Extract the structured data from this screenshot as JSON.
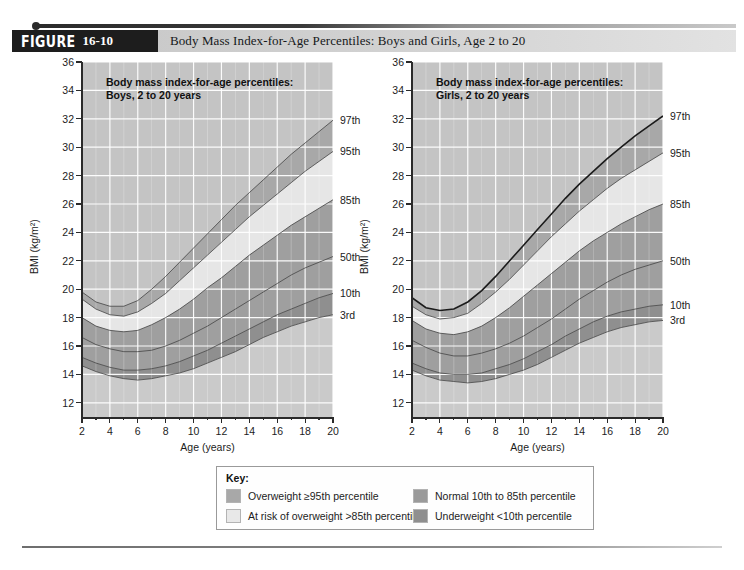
{
  "header": {
    "figure_word": "FIGURE",
    "figure_number": "16-10",
    "title": "Body Mass Index-for-Age Percentiles: Boys and Girls, Age 2 to 20"
  },
  "key": {
    "title": "Key:",
    "items": [
      {
        "label": "Overweight ≥95th percentile",
        "color": "#a8a8a8"
      },
      {
        "label": "At risk of overweight >85th percentile",
        "color": "#e8e8e8"
      },
      {
        "label": "Normal 10th to 85th percentile",
        "color": "#9a9a9a"
      },
      {
        "label": "Underweight <10th percentile",
        "color": "#8f8f8f"
      }
    ]
  },
  "chart_data": [
    {
      "type": "area",
      "id": "boys",
      "title": "Body mass index-for-age percentiles:\nBoys, 2 to 20 years",
      "xlabel": "Age (years)",
      "ylabel": "BMI (kg/m²)",
      "xlim": [
        2,
        20
      ],
      "ylim": [
        11,
        36
      ],
      "grid": true,
      "highlight_series": null,
      "xticks": [
        2,
        4,
        6,
        8,
        10,
        12,
        14,
        16,
        18,
        20
      ],
      "yticks": [
        12,
        14,
        16,
        18,
        20,
        22,
        24,
        26,
        28,
        30,
        32,
        34,
        36
      ],
      "x": [
        2,
        3,
        4,
        5,
        6,
        7,
        8,
        9,
        10,
        11,
        12,
        13,
        14,
        15,
        16,
        17,
        18,
        19,
        20
      ],
      "series": [
        {
          "name": "3rd",
          "label": "3rd",
          "values": [
            14.6,
            14.2,
            13.9,
            13.7,
            13.6,
            13.7,
            13.9,
            14.1,
            14.4,
            14.8,
            15.2,
            15.6,
            16.1,
            16.6,
            17.0,
            17.4,
            17.7,
            18.0,
            18.2
          ]
        },
        {
          "name": "10th",
          "label": "10th",
          "values": [
            15.2,
            14.8,
            14.5,
            14.3,
            14.3,
            14.4,
            14.6,
            14.9,
            15.3,
            15.7,
            16.2,
            16.7,
            17.2,
            17.7,
            18.2,
            18.6,
            19.0,
            19.4,
            19.7
          ]
        },
        {
          "name": "50th",
          "label": "50th",
          "values": [
            16.6,
            16.1,
            15.8,
            15.6,
            15.6,
            15.7,
            16.0,
            16.4,
            16.9,
            17.4,
            18.0,
            18.6,
            19.2,
            19.8,
            20.4,
            21.0,
            21.5,
            21.9,
            22.3
          ]
        },
        {
          "name": "85th",
          "label": "85th",
          "values": [
            18.0,
            17.4,
            17.1,
            17.0,
            17.1,
            17.5,
            18.0,
            18.6,
            19.3,
            20.1,
            20.8,
            21.6,
            22.4,
            23.1,
            23.8,
            24.5,
            25.1,
            25.7,
            26.3
          ]
        },
        {
          "name": "95th",
          "label": "95th",
          "values": [
            19.3,
            18.6,
            18.2,
            18.1,
            18.4,
            19.0,
            19.7,
            20.6,
            21.5,
            22.4,
            23.3,
            24.2,
            25.1,
            25.9,
            26.7,
            27.5,
            28.3,
            29.0,
            29.7
          ]
        },
        {
          "name": "97th",
          "label": "97th",
          "values": [
            19.8,
            19.1,
            18.8,
            18.8,
            19.2,
            20.0,
            20.9,
            21.9,
            22.9,
            23.9,
            24.9,
            25.9,
            26.8,
            27.7,
            28.6,
            29.5,
            30.3,
            31.1,
            31.9
          ]
        }
      ]
    },
    {
      "type": "area",
      "id": "girls",
      "title": "Body mass index-for-age percentiles:\nGirls, 2 to 20 years",
      "xlabel": "Age (years)",
      "ylabel": "BMI (kg/m²)",
      "xlim": [
        2,
        20
      ],
      "ylim": [
        11,
        36
      ],
      "grid": true,
      "highlight_series": "97th",
      "xticks": [
        2,
        4,
        6,
        8,
        10,
        12,
        14,
        16,
        18,
        20
      ],
      "yticks": [
        12,
        14,
        16,
        18,
        20,
        22,
        24,
        26,
        28,
        30,
        32,
        34,
        36
      ],
      "x": [
        2,
        3,
        4,
        5,
        6,
        7,
        8,
        9,
        10,
        11,
        12,
        13,
        14,
        15,
        16,
        17,
        18,
        19,
        20
      ],
      "series": [
        {
          "name": "3rd",
          "label": "3rd",
          "values": [
            14.3,
            13.9,
            13.6,
            13.5,
            13.4,
            13.5,
            13.7,
            14.0,
            14.3,
            14.7,
            15.2,
            15.7,
            16.2,
            16.6,
            17.0,
            17.3,
            17.5,
            17.7,
            17.8
          ]
        },
        {
          "name": "10th",
          "label": "10th",
          "values": [
            14.8,
            14.4,
            14.1,
            14.0,
            14.0,
            14.1,
            14.4,
            14.7,
            15.1,
            15.6,
            16.1,
            16.7,
            17.2,
            17.7,
            18.1,
            18.4,
            18.6,
            18.8,
            18.9
          ]
        },
        {
          "name": "50th",
          "label": "50th",
          "values": [
            16.4,
            15.9,
            15.5,
            15.3,
            15.3,
            15.5,
            15.8,
            16.2,
            16.7,
            17.3,
            17.9,
            18.6,
            19.3,
            19.9,
            20.5,
            21.0,
            21.4,
            21.7,
            22.0
          ]
        },
        {
          "name": "85th",
          "label": "85th",
          "values": [
            17.8,
            17.2,
            16.9,
            16.8,
            17.0,
            17.4,
            18.0,
            18.7,
            19.5,
            20.3,
            21.1,
            21.9,
            22.7,
            23.4,
            24.0,
            24.6,
            25.1,
            25.6,
            26.0
          ]
        },
        {
          "name": "95th",
          "label": "95th",
          "values": [
            18.8,
            18.2,
            17.9,
            18.0,
            18.3,
            19.0,
            19.8,
            20.7,
            21.7,
            22.7,
            23.7,
            24.6,
            25.5,
            26.3,
            27.1,
            27.8,
            28.4,
            29.0,
            29.6
          ]
        },
        {
          "name": "97th",
          "label": "97th",
          "values": [
            19.4,
            18.7,
            18.5,
            18.6,
            19.1,
            19.9,
            20.9,
            22.0,
            23.1,
            24.2,
            25.3,
            26.4,
            27.4,
            28.3,
            29.2,
            30.0,
            30.8,
            31.5,
            32.2
          ]
        }
      ]
    }
  ],
  "band_colors": {
    "below_3rd": "#cacaca",
    "underweight": "#8f8f8f",
    "normal": "#9f9f9f",
    "at_risk": "#e6e6e6",
    "overweight": "#a8a8a8",
    "above_97th": "#c4c4c4",
    "plot_bg": "#c4c4c4",
    "grid": "#ffffff",
    "curve": "#4a4a4a",
    "highlight_curve": "#1b1b1b"
  }
}
